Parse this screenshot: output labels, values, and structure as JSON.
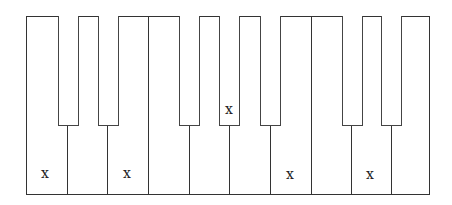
{
  "diagram": {
    "type": "piano-keyboard",
    "white_keys": [
      "C",
      "D",
      "E",
      "F",
      "G",
      "A",
      "B",
      "C",
      "D",
      "E"
    ],
    "black_keys": [
      "C#",
      "D#",
      "F#",
      "G#",
      "A#",
      "C#",
      "D#"
    ],
    "marked_keys": [
      {
        "key": "C",
        "kind": "white",
        "index": 0,
        "label": "x"
      },
      {
        "key": "E",
        "kind": "white",
        "index": 2,
        "label": "x"
      },
      {
        "key": "G#",
        "kind": "black",
        "index": 3,
        "label": "x"
      },
      {
        "key": "B",
        "kind": "white",
        "index": 6,
        "label": "x"
      },
      {
        "key": "D",
        "kind": "white",
        "index": 8,
        "label": "x"
      }
    ],
    "colors": {
      "outline": "#333333",
      "key_fill": "#ffffff",
      "mark": "#222222"
    }
  }
}
